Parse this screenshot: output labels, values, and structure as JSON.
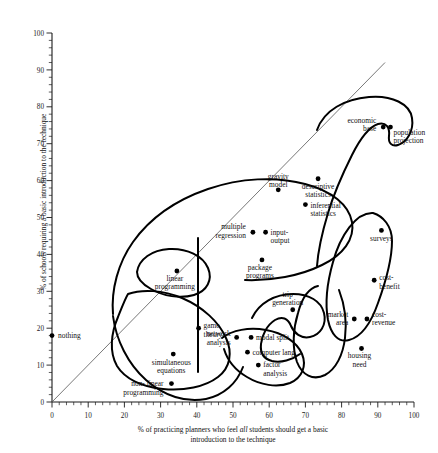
{
  "chart_data": {
    "type": "scatter",
    "title": "",
    "xlabel": "% of practicing planners who feel all students should get a basic introduction to the technique",
    "xlabel_part1": "% of practicing planners who feel ",
    "xlabel_emphasis": "all",
    "xlabel_part2": " students should get a basic",
    "xlabel_line2": "introduction to the technique",
    "ylabel": "% of schools requiring a basic introduction to the technique",
    "xlim": [
      0,
      100
    ],
    "ylim": [
      0,
      100
    ],
    "xticks": [
      0,
      10,
      20,
      30,
      40,
      50,
      60,
      70,
      80,
      90,
      100
    ],
    "yticks": [
      0,
      10,
      20,
      30,
      40,
      50,
      60,
      70,
      80,
      90,
      100
    ],
    "xtick_labels": [
      "0",
      "10",
      "20",
      "30",
      "40",
      "50",
      "60",
      "70",
      "80",
      "90",
      "100"
    ],
    "ytick_labels": [
      "0",
      "10",
      "20",
      "30",
      "40",
      "50",
      "60",
      "70",
      "80",
      "90",
      "100"
    ],
    "minor_tick_interval": 2,
    "grid": false,
    "legend": false,
    "reference_line": {
      "name": "forty-five-degree-line",
      "description": "diagonal identity line y = x",
      "from": [
        0,
        0
      ],
      "to": [
        92,
        92
      ]
    },
    "points": [
      {
        "label": "nothing",
        "x": 0,
        "y": 18,
        "label_pos": "right"
      },
      {
        "label": "economic base",
        "x": 91.5,
        "y": 74.5,
        "label_pos": "left"
      },
      {
        "label": "population projection",
        "x": 93.5,
        "y": 74.5,
        "label_pos": "below-right"
      },
      {
        "label": "descriptive statistics",
        "x": 73.5,
        "y": 60.5,
        "label_pos": "below"
      },
      {
        "label": "inferential statistics",
        "x": 70,
        "y": 53.5,
        "label_pos": "below-right"
      },
      {
        "label": "gravity model",
        "x": 62.5,
        "y": 57.5,
        "label_pos": "above"
      },
      {
        "label": "multiple regression",
        "x": 55.5,
        "y": 46,
        "label_pos": "left"
      },
      {
        "label": "input-output",
        "x": 59,
        "y": 46,
        "label_pos": "right"
      },
      {
        "label": "package programs",
        "x": 58,
        "y": 38.5,
        "label_pos": "below"
      },
      {
        "label": "surveys",
        "x": 91,
        "y": 46.5,
        "label_pos": "below"
      },
      {
        "label": "cost-benefit",
        "x": 89,
        "y": 33,
        "label_pos": "right"
      },
      {
        "label": "linear programming",
        "x": 34.5,
        "y": 35.5,
        "label_pos": "below"
      },
      {
        "label": "trip generation",
        "x": 66.5,
        "y": 25,
        "label_pos": "above-left"
      },
      {
        "label": "market area",
        "x": 83.5,
        "y": 22.5,
        "label_pos": "left"
      },
      {
        "label": "cost-revenue",
        "x": 87,
        "y": 22.5,
        "label_pos": "right"
      },
      {
        "label": "game theory",
        "x": 40.5,
        "y": 20,
        "label_pos": "right"
      },
      {
        "label": "modal split",
        "x": 55,
        "y": 17.5,
        "label_pos": "right"
      },
      {
        "label": "network analysis",
        "x": 51,
        "y": 17.5,
        "label_pos": "left"
      },
      {
        "label": "computer lang.",
        "x": 54,
        "y": 13.5,
        "label_pos": "right"
      },
      {
        "label": "housing need",
        "x": 85.5,
        "y": 14.5,
        "label_pos": "below"
      },
      {
        "label": "simultaneous equations",
        "x": 33.5,
        "y": 13,
        "label_pos": "below"
      },
      {
        "label": "factor analysis",
        "x": 57,
        "y": 10,
        "label_pos": "right"
      },
      {
        "label": "non-linear programming",
        "x": 33,
        "y": 5,
        "label_pos": "split"
      }
    ],
    "clusters": [
      {
        "name": "linear-programming-cluster",
        "members": [
          "linear programming"
        ]
      },
      {
        "name": "economic-base-cluster",
        "members": [
          "economic base",
          "population projection"
        ]
      },
      {
        "name": "surveys-cost-benefit-cluster",
        "members": [
          "surveys",
          "cost-benefit"
        ]
      },
      {
        "name": "market-area-cluster",
        "members": [
          "market area",
          "cost-revenue",
          "housing need"
        ]
      },
      {
        "name": "trip-generation-cluster",
        "members": [
          "trip generation",
          "modal split"
        ]
      },
      {
        "name": "computer-factor-cluster",
        "members": [
          "computer lang.",
          "factor analysis"
        ]
      },
      {
        "name": "low-use-cluster",
        "members": [
          "game theory",
          "network analysis",
          "simultaneous equations",
          "non-linear programming"
        ]
      },
      {
        "name": "regression-cluster",
        "members": [
          "multiple regression",
          "input-output",
          "package programs",
          "gravity model",
          "inferential statistics"
        ]
      }
    ],
    "colors": {
      "axis": "#1a1a1a",
      "dot": "#000000",
      "contour": "#000000",
      "reference_line": "#555555",
      "background": "#ffffff"
    }
  }
}
